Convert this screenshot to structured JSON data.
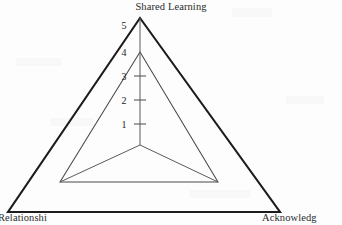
{
  "chart_data": {
    "type": "radar",
    "title": "Shared Learning",
    "categories": [
      "Shared Learning",
      "Acknowledgement",
      "Relationship"
    ],
    "axis_labels": {
      "top": "Shared Learning",
      "bottom_right": "Acknowledg",
      "bottom_left": "Relationshi"
    },
    "series": [
      {
        "name": "Outer boundary",
        "values": [
          5,
          5,
          5
        ],
        "style": "bold-outline"
      },
      {
        "name": "Data",
        "values": [
          4,
          3,
          3
        ],
        "style": "thin-outline"
      }
    ],
    "tick_labels": [
      "5",
      "4",
      "3",
      "2",
      "1"
    ],
    "tick_values": [
      5,
      4,
      3,
      2,
      1
    ],
    "rlim": [
      0,
      5
    ],
    "grid": false,
    "legend": "none",
    "axis_count": 3
  },
  "geometry": {
    "center_x": 140,
    "center_y": 145,
    "outer_apex_y": 18,
    "outer_left_x": 8,
    "outer_right_x": 280,
    "outer_base_y": 212,
    "inner_apex_y": 52,
    "inner_left_x": 60,
    "inner_right_x": 218,
    "inner_base_y": 182,
    "tick_y": [
      25,
      52,
      76,
      100,
      124
    ],
    "tick_label_x": 124,
    "tick_mark_half_width": 6
  },
  "colors": {
    "background": "#fdfdfd",
    "outer_stroke": "#1c1c1c",
    "inner_stroke": "#4a4a4a",
    "axis_stroke": "#5a5a5a",
    "text": "#2b2b2b"
  }
}
